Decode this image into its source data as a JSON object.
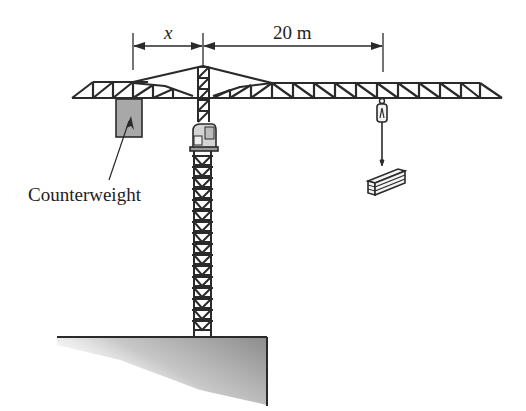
{
  "figure": {
    "dimensions": {
      "left_label": "x",
      "right_label": "20 m"
    },
    "labels": {
      "counterweight": "Counterweight"
    },
    "colors": {
      "stroke": "#2a2a2a",
      "counterweight_fill": "#a8a8a8",
      "ground_shade": "#9a9a9a"
    }
  }
}
